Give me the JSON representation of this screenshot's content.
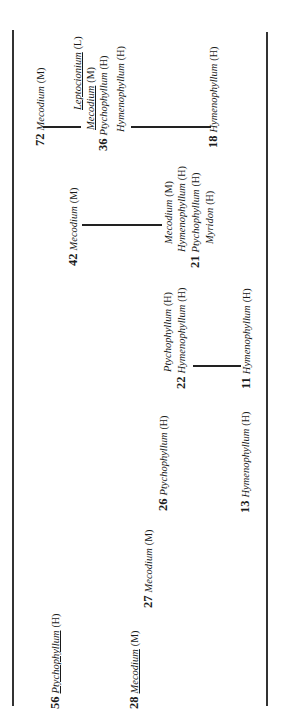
{
  "diagram": {
    "borders": {
      "left": true,
      "right": true
    },
    "nodes": [
      {
        "id": "n72",
        "number": "72",
        "entries": [
          {
            "genus": "Mecodium",
            "code": "(M)",
            "underline": false
          }
        ]
      },
      {
        "id": "n36",
        "number": "36",
        "entries": [
          {
            "genus": "Leptocionium",
            "code": "(L)",
            "underline": true
          },
          {
            "genus": "Mecodium",
            "code": "(M)",
            "underline": true
          },
          {
            "genus": "Ptychophyllum",
            "code": "(H)",
            "underline": false,
            "numbered": true
          },
          {
            "genus": "Hymenophyllum",
            "code": "(H)",
            "underline": false
          }
        ]
      },
      {
        "id": "n18",
        "number": "18",
        "entries": [
          {
            "genus": "Hymenophyllum",
            "code": "(H)",
            "underline": false
          }
        ]
      },
      {
        "id": "n42",
        "number": "42",
        "entries": [
          {
            "genus": "Mecodium",
            "code": "(M)",
            "underline": false
          }
        ]
      },
      {
        "id": "n21",
        "number": "21",
        "entries": [
          {
            "genus": "Mecodium",
            "code": "(M)",
            "underline": false
          },
          {
            "genus": "Hymenophyllum",
            "code": "(H)",
            "underline": false
          },
          {
            "genus": "Ptychophyllum",
            "code": "(H)",
            "underline": false,
            "numbered": true
          },
          {
            "genus": "Myridon",
            "code": "(H)",
            "underline": false
          }
        ]
      },
      {
        "id": "n22",
        "number": "22",
        "entries": [
          {
            "genus": "Ptychophyllum",
            "code": "(H)",
            "underline": false
          },
          {
            "genus": "Hymenophyllum",
            "code": "(H)",
            "underline": false,
            "numbered": true
          }
        ]
      },
      {
        "id": "n11",
        "number": "11",
        "entries": [
          {
            "genus": "Hymenophyllum",
            "code": "(H)",
            "underline": false
          }
        ]
      },
      {
        "id": "n26",
        "number": "26",
        "entries": [
          {
            "genus": "Ptychophyllum",
            "code": "(H)",
            "underline": false
          }
        ]
      },
      {
        "id": "n13",
        "number": "13",
        "entries": [
          {
            "genus": "Hymenophyllum",
            "code": "(H)",
            "underline": false
          }
        ]
      },
      {
        "id": "n27",
        "number": "27",
        "entries": [
          {
            "genus": "Mecodium",
            "code": "(M)",
            "underline": false
          }
        ]
      },
      {
        "id": "n56",
        "number": "56",
        "entries": [
          {
            "genus": "Ptychophyllum",
            "code": "(H)",
            "underline": true
          }
        ]
      },
      {
        "id": "n28",
        "number": "28",
        "entries": [
          {
            "genus": "Mecodium",
            "code": "(M)",
            "underline": true
          }
        ]
      }
    ],
    "connections": [
      {
        "from": "72",
        "to": "36"
      },
      {
        "from": "36",
        "to": "18"
      },
      {
        "from": "42",
        "to": "21"
      },
      {
        "from": "22",
        "to": "11"
      }
    ]
  }
}
